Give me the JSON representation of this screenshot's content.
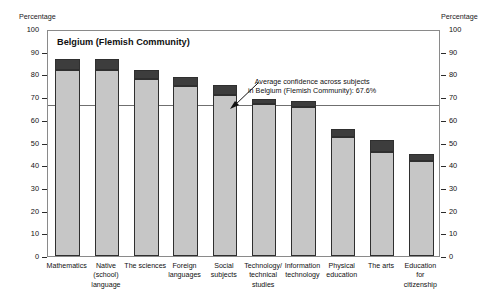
{
  "chart_data": {
    "type": "bar",
    "title": "Belgium (Flemish Community)",
    "xlabel": "",
    "ylabel": "Percentage",
    "ylabel_right": "Percentage",
    "ylim": [
      0,
      100
    ],
    "yticks": [
      0,
      10,
      20,
      30,
      40,
      50,
      60,
      70,
      80,
      90,
      100
    ],
    "grid": false,
    "legend": "none",
    "stacked": true,
    "categories": [
      "Mathematics",
      "Native (school) language",
      "The sciences",
      "Foreign languages",
      "Social subjects",
      "Technology/ technical studies",
      "Information technology",
      "Physical education",
      "The arts",
      "Education for citizenship"
    ],
    "category_lines": [
      [
        "Mathematics"
      ],
      [
        "Native",
        "(school)",
        "language"
      ],
      [
        "The sciences"
      ],
      [
        "Foreign",
        "languages"
      ],
      [
        "Social",
        "subjects"
      ],
      [
        "Technology/",
        "technical",
        "studies"
      ],
      [
        "Information",
        "technology"
      ],
      [
        "Physical",
        "education"
      ],
      [
        "The arts"
      ],
      [
        "Education",
        "for",
        "citizenship"
      ]
    ],
    "series": [
      {
        "name": "lower",
        "color": "#c6c6c6",
        "values": [
          82.0,
          82.0,
          78.0,
          75.0,
          71.0,
          67.0,
          65.5,
          52.5,
          46.0,
          42.0
        ]
      },
      {
        "name": "upper",
        "color": "#3d3d3d",
        "values": [
          4.7,
          4.7,
          4.0,
          4.0,
          4.3,
          2.3,
          2.7,
          3.5,
          5.0,
          3.0
        ]
      }
    ],
    "totals": [
      86.7,
      86.7,
      82.0,
      79.0,
      75.3,
      69.3,
      68.2,
      56.0,
      51.0,
      45.0
    ],
    "reference_line": {
      "value": 67.6,
      "label_line1": "Average confidence across subjects",
      "label_line2": "in Belgium (Flemish Community): 67.6%"
    }
  },
  "annotations": {
    "arrow": "arrow-to-reference-line"
  }
}
